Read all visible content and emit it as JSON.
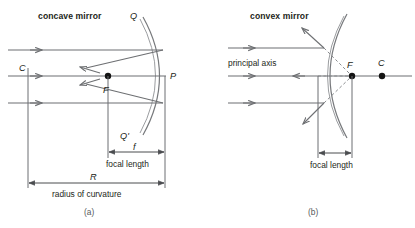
{
  "figure": {
    "background_color": "#ffffff",
    "line_color": "#6d6f72",
    "text_color": "#231f20",
    "accent_color": "#141414"
  },
  "panel_a": {
    "title": "concave mirror",
    "caption": "(a)",
    "points": {
      "top_edge": "Q",
      "bottom_edge": "Q'",
      "vertex": "P",
      "focus": "F",
      "center_of_curvature": "C"
    },
    "dimensions": [
      {
        "symbol": "f",
        "label": "focal length"
      },
      {
        "symbol": "R",
        "label": "radius of curvature"
      }
    ],
    "ray_count": 3
  },
  "panel_b": {
    "title": "convex mirror",
    "caption": "(b)",
    "axis_label": "principal axis",
    "points": {
      "focus": "F",
      "center_of_curvature": "C"
    },
    "dimensions": [
      {
        "symbol": "",
        "label": "focal length"
      }
    ],
    "ray_count": 3
  }
}
